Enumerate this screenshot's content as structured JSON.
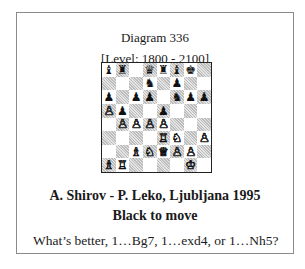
{
  "diagram": {
    "title": "Diagram 336",
    "level": "[Level: 1800 - 2100]",
    "game": "A. Shirov - P. Leko, Ljubljana 1995",
    "to_move": "Black to move",
    "question": "What’s better, 1…Bg7, 1…exd4, or 1…Nh5?"
  },
  "board": {
    "orientation": "white-bottom",
    "fen": "bq1qrbk1/3n1p2/p1pp1npp/Pp2p3/1PPPP3/4RN1P/2BNQPP1/BR4K1",
    "ranks": [
      [
        "bB",
        "bR",
        "",
        "bQ",
        "bR",
        "bB",
        "bK",
        ""
      ],
      [
        "",
        "",
        "",
        "bN",
        "",
        "bP",
        "",
        ""
      ],
      [
        "bP",
        "",
        "bP",
        "bP",
        "",
        "bN",
        "bP",
        "bP"
      ],
      [
        "wP",
        "bP",
        "",
        "",
        "bP",
        "",
        "",
        ""
      ],
      [
        "",
        "wP",
        "wP",
        "wP",
        "wP",
        "",
        "",
        ""
      ],
      [
        "",
        "",
        "",
        "",
        "wR",
        "wN",
        "",
        "wP"
      ],
      [
        "",
        "",
        "wB",
        "wN",
        "wQ",
        "wP",
        "wP",
        ""
      ],
      [
        "wB",
        "wR",
        "",
        "",
        "",
        "",
        "wK",
        ""
      ]
    ],
    "glyphs": {
      "wK": "♔",
      "wQ": "♕",
      "wR": "♖",
      "wB": "♗",
      "wN": "♘",
      "wP": "♙",
      "bK": "♚",
      "bQ": "♛",
      "bR": "♜",
      "bB": "♝",
      "bN": "♞",
      "bP": "♟"
    },
    "names": {
      "K": "king",
      "Q": "queen",
      "R": "rook",
      "B": "bishop",
      "N": "knight",
      "P": "pawn"
    }
  }
}
